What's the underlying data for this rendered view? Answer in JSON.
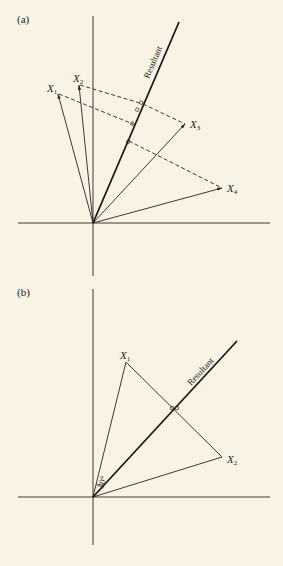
{
  "panels": [
    {
      "id": "a",
      "label": "(a)",
      "origin": [
        93,
        223
      ],
      "vectors": [
        {
          "name": "X",
          "sub": "1",
          "tip": [
            58,
            94
          ],
          "label_pos": [
            46,
            90
          ]
        },
        {
          "name": "X",
          "sub": "2",
          "tip": [
            79,
            85
          ],
          "label_pos": [
            73,
            81
          ]
        },
        {
          "name": "X",
          "sub": "3",
          "tip": [
            185,
            124
          ],
          "label_pos": [
            190,
            128
          ]
        },
        {
          "name": "X",
          "sub": "4",
          "tip": [
            222,
            188
          ],
          "label_pos": [
            227,
            192
          ]
        }
      ],
      "resultant": {
        "label": "Resultant",
        "end": [
          179,
          22
        ]
      },
      "projection_note": "dashed perpendiculars from vector tips to resultant"
    },
    {
      "id": "b",
      "label": "(b)",
      "origin": [
        93,
        497
      ],
      "vectors": [
        {
          "name": "X",
          "sub": "1",
          "tip": [
            126,
            362
          ],
          "label_pos": [
            120,
            357
          ]
        },
        {
          "name": "X",
          "sub": "2",
          "tip": [
            222,
            457
          ],
          "label_pos": [
            227,
            464
          ]
        }
      ],
      "resultant": {
        "label": "Resultant",
        "end": [
          237,
          341
        ]
      },
      "angle_label": "30°"
    }
  ],
  "colors": {
    "background": "#f8f3e4",
    "ink": "#2a2520"
  }
}
